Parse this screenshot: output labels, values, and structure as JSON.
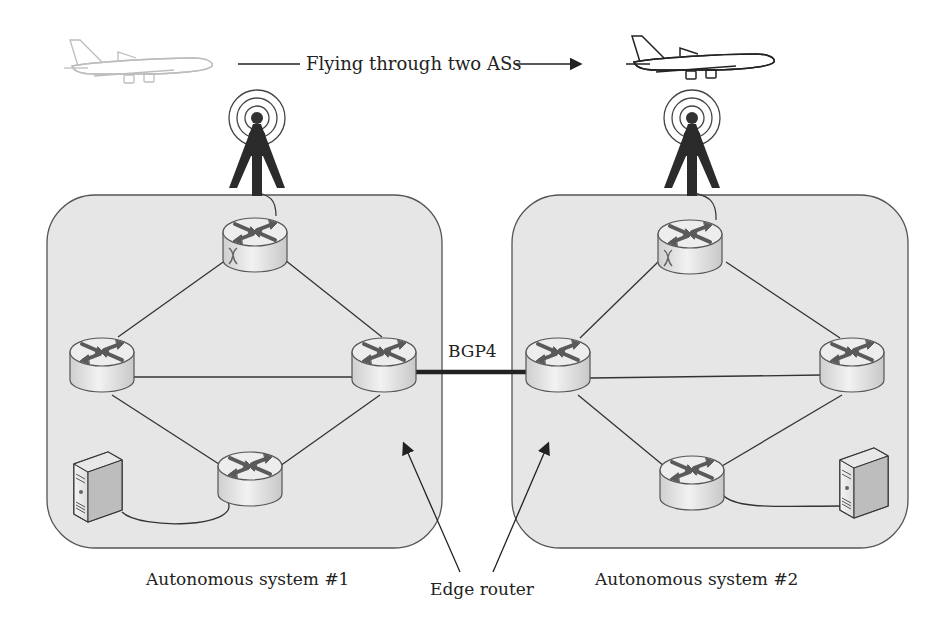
{
  "title": {
    "text": "Flying through two ASs"
  },
  "link_label": "BGP4",
  "autonomous_systems": [
    {
      "label": "Autonomous system #1",
      "box": {
        "x": 47,
        "y": 195,
        "w": 395,
        "h": 353,
        "r": 48
      },
      "routers": [
        {
          "role": "top-access-router",
          "cx": 255,
          "cy": 240
        },
        {
          "role": "left-router",
          "cx": 102,
          "cy": 360
        },
        {
          "role": "edge-router",
          "cx": 384,
          "cy": 360
        },
        {
          "role": "bottom-router",
          "cx": 250,
          "cy": 474
        }
      ],
      "server": {
        "x": 74,
        "y": 460
      }
    },
    {
      "label": "Autonomous system #2",
      "box": {
        "x": 512,
        "y": 195,
        "w": 396,
        "h": 353,
        "r": 48
      },
      "routers": [
        {
          "role": "top-access-router",
          "cx": 690,
          "cy": 240
        },
        {
          "role": "edge-router",
          "cx": 558,
          "cy": 360
        },
        {
          "role": "right-router",
          "cx": 852,
          "cy": 360
        },
        {
          "role": "bottom-router",
          "cx": 692,
          "cy": 477
        }
      ],
      "server": {
        "x": 840,
        "y": 455
      }
    }
  ],
  "callout_label": "Edge router",
  "colors": {
    "as_fill": "#e6e6e6",
    "as_stroke": "#555555",
    "link": "#333333",
    "bgp_link": "#222222",
    "router_top": "#eeeeee",
    "router_side": "#d9d9d9",
    "arrow": "#555555",
    "text": "#222222"
  },
  "icons": [
    "airplane-icon",
    "radio-tower-icon",
    "router-icon",
    "server-icon",
    "arrow-icon"
  ]
}
